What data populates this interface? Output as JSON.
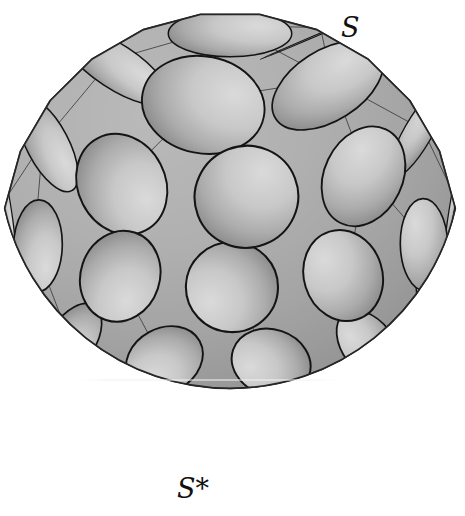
{
  "figure": {
    "kind": "sphere-circle-packing-diagram",
    "background_color": "#ffffff",
    "canvas": {
      "width": 465,
      "height": 516
    }
  },
  "labels": {
    "top_right": {
      "text": "S",
      "meaning": "sphere-label",
      "x": 341,
      "y": 12,
      "font_size": 27,
      "style": "italic",
      "color": "#111111"
    },
    "bottom_center": {
      "text": "S*",
      "meaning": "dual-sphere-label",
      "x": 177,
      "y": 473,
      "font_size": 27,
      "style": "italic",
      "color": "#111111"
    }
  },
  "sphere": {
    "center_x": 230,
    "center_y": 240,
    "radius": 231,
    "light_direction": "upper-left",
    "fill_light": "#cfcfcf",
    "fill_mid": "#b4b4b4",
    "fill_dark": "#8c8c8c",
    "fill_edge": "#7e7e7e",
    "outline_color": "#2b2b2b",
    "outline_width": 1.6
  },
  "packing": {
    "description": "Circles packed tangentially on the sphere surface, drawn as foreshortened ellipses, with a thin triangulation connecting tangent circle centers.",
    "circle_fill": "#c3c3c3",
    "circle_stroke": "#141414",
    "circle_stroke_width": 2.1,
    "gap_fill": "#a2a2a2",
    "triangulation_stroke": "#2e2e2e",
    "triangulation_width": 0.75,
    "visible_circle_count": 54,
    "rings": [
      {
        "name": "pole-cap",
        "polar_deg": 0,
        "count": 1,
        "angular_radius_deg": 15.5
      },
      {
        "name": "ring-1",
        "polar_deg": 31,
        "count": 5,
        "angular_radius_deg": 15.5
      },
      {
        "name": "ring-2",
        "polar_deg": 57,
        "count": 9,
        "angular_radius_deg": 13.0
      },
      {
        "name": "ring-3",
        "polar_deg": 80,
        "count": 12,
        "angular_radius_deg": 11.5
      },
      {
        "name": "ring-4",
        "polar_deg": 101,
        "count": 13,
        "angular_radius_deg": 10.0
      },
      {
        "name": "ring-5",
        "polar_deg": 119,
        "count": 16,
        "angular_radius_deg": 8.4
      },
      {
        "name": "ring-6",
        "polar_deg": 134,
        "count": 20,
        "angular_radius_deg": 6.6
      },
      {
        "name": "ring-7",
        "polar_deg": 146,
        "count": 26,
        "angular_radius_deg": 5.2
      }
    ],
    "view": {
      "tilt_deg": 22,
      "rotation_deg": 14,
      "projection": "orthographic"
    }
  },
  "silhouette": {
    "type": "polygonal-faceted-upper-edge",
    "facet_count": 11,
    "note": "The upper-left limb shows flat polyhedral facets; the lower limb is a smooth shaded crescent."
  },
  "artifacts": {
    "scanline": {
      "present": true,
      "y": 380,
      "color": "#e8e8e8",
      "opacity": 0.55,
      "x_start": 70,
      "x_end": 350
    }
  }
}
